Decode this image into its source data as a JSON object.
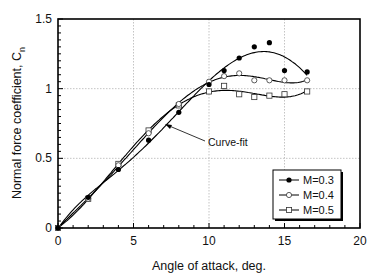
{
  "chart_data": {
    "type": "scatter",
    "title": "",
    "xlabel": "Angle of attack, deg.",
    "ylabel": "Normal force coefficient, C",
    "ylabel_subscript": "n",
    "xlim": [
      0,
      20
    ],
    "ylim": [
      0,
      1.5
    ],
    "x_ticks": [
      0,
      5,
      10,
      15,
      20
    ],
    "x_tick_labels": [
      "0",
      "5",
      "10",
      "15",
      "20"
    ],
    "y_ticks": [
      0,
      0.5,
      1,
      1.5
    ],
    "y_tick_labels": [
      "0",
      "0.5",
      "1",
      "1.5"
    ],
    "grid": true,
    "legend_position": "lower right",
    "annotation": "Curve-fit",
    "series": [
      {
        "name": "M=0.3",
        "marker": "filled-circle",
        "color": "#000000",
        "x": [
          0,
          2,
          4,
          6,
          8,
          10,
          11,
          12,
          13,
          14,
          15,
          16.5
        ],
        "y": [
          0.0,
          0.22,
          0.42,
          0.63,
          0.83,
          1.03,
          1.13,
          1.22,
          1.3,
          1.33,
          1.13,
          1.12
        ]
      },
      {
        "name": "M=0.4",
        "marker": "open-circle",
        "color": "#000000",
        "x": [
          0,
          2,
          4,
          6,
          8,
          10,
          11,
          12,
          13,
          14,
          15,
          16.5
        ],
        "y": [
          0.0,
          0.21,
          0.45,
          0.68,
          0.89,
          1.05,
          1.09,
          1.11,
          1.06,
          1.06,
          1.06,
          1.06
        ]
      },
      {
        "name": "M=0.5",
        "marker": "open-square",
        "color": "#000000",
        "x": [
          0,
          2,
          4,
          6,
          8,
          10,
          11,
          12,
          13,
          14,
          15,
          16.5
        ],
        "y": [
          0.0,
          0.21,
          0.46,
          0.7,
          0.88,
          0.98,
          1.02,
          0.96,
          0.94,
          0.95,
          0.96,
          0.98
        ]
      }
    ]
  }
}
